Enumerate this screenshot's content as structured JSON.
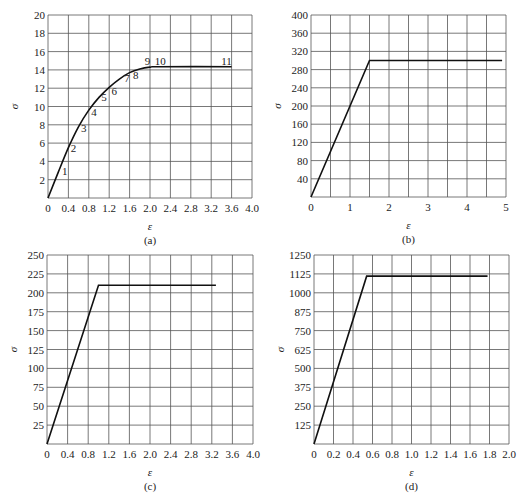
{
  "chart_data": [
    {
      "id": "a",
      "type": "line",
      "caption": "(a)",
      "xlabel": "ε",
      "ylabel": "σ",
      "xlim": [
        0,
        4.0
      ],
      "ylim": [
        0,
        20
      ],
      "xticks": [
        "0",
        "0.4",
        "0.8",
        "1.2",
        "1.6",
        "2.0",
        "2.4",
        "2.8",
        "3.2",
        "3.6",
        "4.0"
      ],
      "yticks": [
        "2",
        "4",
        "6",
        "8",
        "10",
        "12",
        "14",
        "16",
        "18",
        "20"
      ],
      "grid": true,
      "x": [
        0,
        0.2,
        0.4,
        0.6,
        0.8,
        1.0,
        1.2,
        1.4,
        1.6,
        1.8,
        2.0,
        2.2,
        3.6
      ],
      "y": [
        0,
        2.8,
        5.5,
        7.8,
        9.6,
        11.0,
        12.1,
        13.0,
        13.7,
        14.1,
        14.3,
        14.35,
        14.35
      ],
      "point_labels": [
        {
          "label": "1",
          "x": 0.33,
          "y": 2.5
        },
        {
          "label": "2",
          "x": 0.5,
          "y": 5.0
        },
        {
          "label": "3",
          "x": 0.7,
          "y": 7.2
        },
        {
          "label": "4",
          "x": 0.9,
          "y": 9.0
        },
        {
          "label": "5",
          "x": 1.1,
          "y": 10.6
        },
        {
          "label": "6",
          "x": 1.3,
          "y": 11.3
        },
        {
          "label": "7",
          "x": 1.55,
          "y": 12.7
        },
        {
          "label": "8",
          "x": 1.72,
          "y": 13.0
        },
        {
          "label": "9",
          "x": 1.95,
          "y": 14.5
        },
        {
          "label": "10",
          "x": 2.2,
          "y": 14.5
        },
        {
          "label": "11",
          "x": 3.5,
          "y": 14.5
        }
      ]
    },
    {
      "id": "b",
      "type": "line",
      "caption": "(b)",
      "xlabel": "ε",
      "ylabel": "σ",
      "xlim": [
        0,
        5
      ],
      "ylim": [
        0,
        400
      ],
      "xticks": [
        "0",
        "1",
        "2",
        "3",
        "4",
        "5"
      ],
      "xgrid_step": 0.5,
      "yticks": [
        "40",
        "80",
        "120",
        "160",
        "200",
        "240",
        "280",
        "320",
        "360",
        "400"
      ],
      "grid": true,
      "x": [
        0,
        1.5,
        4.9
      ],
      "y": [
        0,
        300,
        300
      ]
    },
    {
      "id": "c",
      "type": "line",
      "caption": "(c)",
      "xlabel": "ε",
      "ylabel": "σ",
      "xlim": [
        0,
        4.0
      ],
      "ylim": [
        0,
        250
      ],
      "xticks": [
        "0",
        "0.4",
        "0.8",
        "1.2",
        "1.6",
        "2.0",
        "2.4",
        "2.8",
        "3.2",
        "3.6",
        "4.0"
      ],
      "yticks": [
        "25",
        "50",
        "75",
        "100",
        "125",
        "150",
        "175",
        "200",
        "225",
        "250"
      ],
      "grid": true,
      "x": [
        0,
        1.0,
        3.28
      ],
      "y": [
        0,
        210,
        210
      ]
    },
    {
      "id": "d",
      "type": "line",
      "caption": "(d)",
      "xlabel": "ε",
      "ylabel": "σ",
      "xlim": [
        0,
        2.0
      ],
      "ylim": [
        0,
        1250
      ],
      "xticks": [
        "0",
        "0.2",
        "0.4",
        "0.6",
        "0.8",
        "1.0",
        "1.2",
        "1.4",
        "1.6",
        "1.8",
        "2.0"
      ],
      "yticks": [
        "125",
        "250",
        "375",
        "500",
        "625",
        "750",
        "875",
        "1000",
        "1125",
        "1250"
      ],
      "grid": true,
      "x": [
        0,
        0.54,
        1.78
      ],
      "y": [
        0,
        1110,
        1110
      ]
    }
  ]
}
